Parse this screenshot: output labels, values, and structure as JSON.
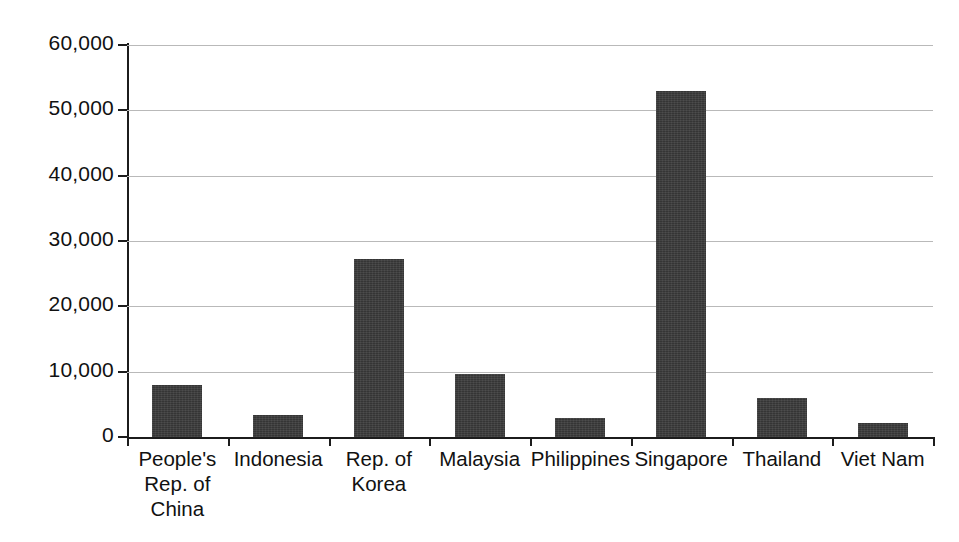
{
  "chart_data": {
    "type": "bar",
    "title": "",
    "subtitle": "",
    "xlabel": "",
    "ylabel": "",
    "categories": [
      "People's Rep. of China",
      "Indonesia",
      "Rep. of Korea",
      "Malaysia",
      "Philippines",
      "Singapore",
      "Thailand",
      "Viet Nam"
    ],
    "category_lines": [
      [
        "People's",
        "Rep. of",
        "China"
      ],
      [
        "Indonesia"
      ],
      [
        "Rep. of",
        "Korea"
      ],
      [
        "Malaysia"
      ],
      [
        "Philippines"
      ],
      [
        "Singapore"
      ],
      [
        "Thailand"
      ],
      [
        "Viet Nam"
      ]
    ],
    "values": [
      8000,
      3400,
      27200,
      9700,
      2900,
      53000,
      5900,
      2200
    ],
    "ylim": [
      0,
      60000
    ],
    "ytick_values": [
      0,
      10000,
      20000,
      30000,
      40000,
      50000,
      60000
    ],
    "ytick_labels": [
      "0",
      "10,000",
      "20,000",
      "30,000",
      "40,000",
      "50,000",
      "60,000"
    ],
    "grid": true,
    "grid_axis": "y",
    "legend": false,
    "legend_position": "none",
    "bar_color": "#3b3b3b",
    "grid_color": "#b9b9b9",
    "axis_color": "#1c1c1c",
    "background_color": "#ffffff"
  }
}
